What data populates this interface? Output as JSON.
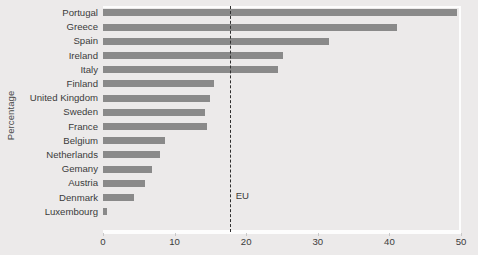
{
  "chart_data": {
    "type": "bar",
    "orientation": "horizontal",
    "title": "",
    "xlabel": "",
    "ylabel": "Percentage",
    "xlim": [
      0,
      50
    ],
    "xticks": [
      0,
      10,
      20,
      30,
      40,
      50
    ],
    "xticklabels": [
      "0",
      "10",
      "20",
      "30",
      "40",
      "50"
    ],
    "grid": false,
    "legend": false,
    "categories": [
      "Portugal",
      "Greece",
      "Spain",
      "Ireland",
      "Italy",
      "Finland",
      "United Kingdom",
      "Sweden",
      "France",
      "Belgium",
      "Netherlands",
      "Gemany",
      "Austria",
      "Denmark",
      "Luxembourg"
    ],
    "values": [
      49.4,
      41.1,
      31.6,
      25.1,
      24.4,
      15.5,
      14.9,
      14.3,
      14.5,
      8.6,
      8.0,
      6.8,
      5.8,
      4.3,
      0.5
    ],
    "bar_color": "#8a8a8a",
    "background_color": "#eceaea",
    "annotations": [
      {
        "name": "eu-average-line",
        "label": "EU",
        "value": 17.7,
        "style": "dashed-vertical",
        "color": "#2f2f2f"
      }
    ]
  }
}
